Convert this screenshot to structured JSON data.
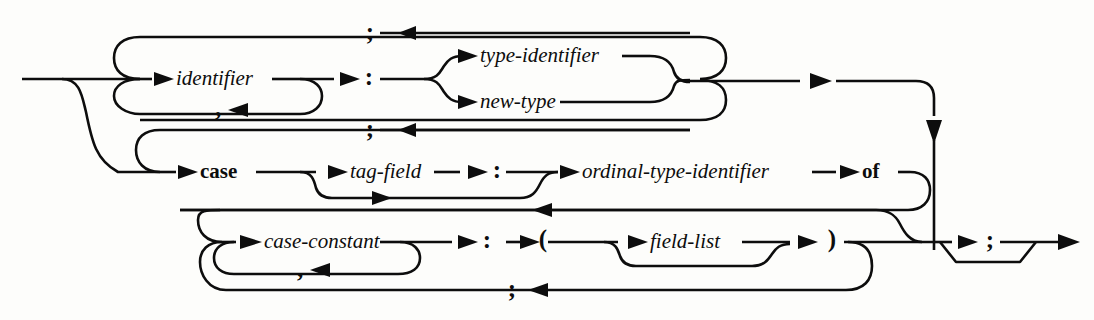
{
  "diagram": {
    "kind": "syntax-railroad-diagram",
    "ink_color": "#0d0d0d",
    "background_color": "#fdfdfb",
    "nonterminals": {
      "identifier": "identifier",
      "type_identifier": "type-identifier",
      "new_type": "new-type",
      "tag_field": "tag-field",
      "ordinal_type_identifier": "ordinal-type-identifier",
      "case_constant": "case-constant",
      "field_list": "field-list"
    },
    "keywords": {
      "case": "case",
      "of": "of"
    },
    "punctuation": {
      "semicolon_top": ";",
      "colon_fixed": ":",
      "comma_identifier": ",",
      "semicolon_case_return": ";",
      "colon_tag": ":",
      "semicolon_variant_return": ";",
      "colon_case_constant": ":",
      "lparen": "(",
      "rparen": ")",
      "comma_case_constant": ",",
      "semicolon_bottom_return": ";",
      "semicolon_exit": ";"
    },
    "rows": [
      {
        "name": "fixed-part",
        "items": [
          "identifier",
          ",",
          ":",
          "type-identifier",
          "new-type",
          ";"
        ]
      },
      {
        "name": "variant-selector",
        "items": [
          "case",
          "tag-field",
          ":",
          "ordinal-type-identifier",
          "of",
          ";"
        ]
      },
      {
        "name": "variant-body",
        "items": [
          "case-constant",
          ",",
          ":",
          "(",
          "field-list",
          ")",
          ";"
        ]
      }
    ],
    "exit": {
      "items": [
        ";"
      ]
    }
  }
}
